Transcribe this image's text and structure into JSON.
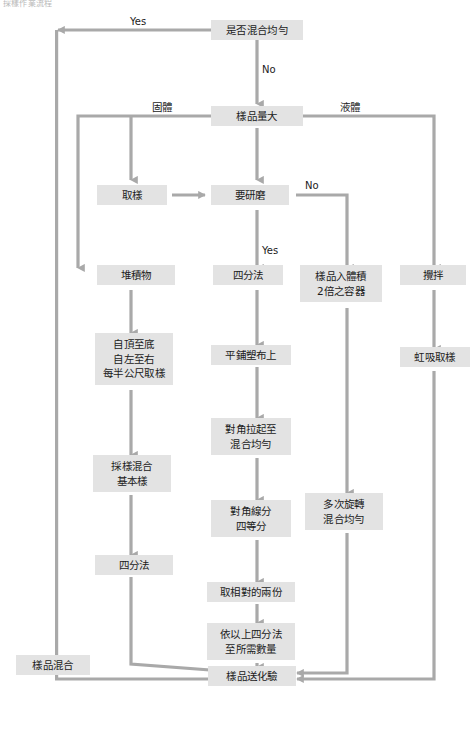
{
  "diagram": {
    "title_fragment": "採樣作業流程",
    "box_fill": "#e3e3e3",
    "wire_color": "#a9a9a9",
    "text_color": "#1b1b1b",
    "background": "#ffffff"
  },
  "nodes": {
    "mix_uniform_check": "是否混合均勻",
    "sample_volume_large": "樣品量大",
    "take_sample": "取樣",
    "need_grind": "要研磨",
    "pile": "堆積物",
    "quarter_method_center": "四分法",
    "into_double_volume_container": "樣品入體積\n2倍之容器",
    "stir": "攪拌",
    "top_to_bottom": "自頂至底\n自左至右\n每半公尺取樣",
    "spread_on_plastic": "平鋪塑布上",
    "siphon_sampling": "虹吸取樣",
    "diagonal_lift_mix": "對角拉起至\n混合均勻",
    "sample_mix_basic": "採樣混合\n基本樣",
    "diagonal_quarter": "對角線分\n四等分",
    "rotate_many_times_mix": "多次旋轉\n混合均勻",
    "quarter_method_left": "四分法",
    "take_two_opposite": "取相對的兩份",
    "repeat_quarter": "依以上四分法\n至所需數量",
    "sample_mix_left": "樣品混合",
    "send_to_lab": "樣品送化驗"
  },
  "edge_labels": {
    "yes_top": "Yes",
    "no_top": "No",
    "solid": "固體",
    "liquid": "液體",
    "no_grind": "No",
    "yes_grind": "Yes"
  }
}
